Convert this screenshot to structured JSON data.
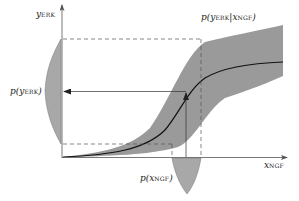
{
  "diagram": {
    "axes": {
      "y_axis_label": "y",
      "y_axis_sub": "ERK",
      "x_axis_label": "x",
      "x_axis_sub": "NGF"
    },
    "labels": {
      "conditional": {
        "prefix": "p(",
        "var": "y",
        "sub": "ERK",
        "bar": "|",
        "var2": "x",
        "sub2": "NGF",
        "suffix": ")"
      },
      "marginal_y": {
        "prefix": "p(",
        "var": "y",
        "sub": "ERK",
        "suffix": ")"
      },
      "marginal_x": {
        "prefix": "p(",
        "var": "x",
        "sub": "NGF",
        "suffix": ")"
      }
    },
    "colors": {
      "band": "#9a9a9a",
      "distribution_fill": "#a8a8a8",
      "curve": "#111111",
      "axis": "#444444",
      "dashed": "#555555"
    }
  }
}
